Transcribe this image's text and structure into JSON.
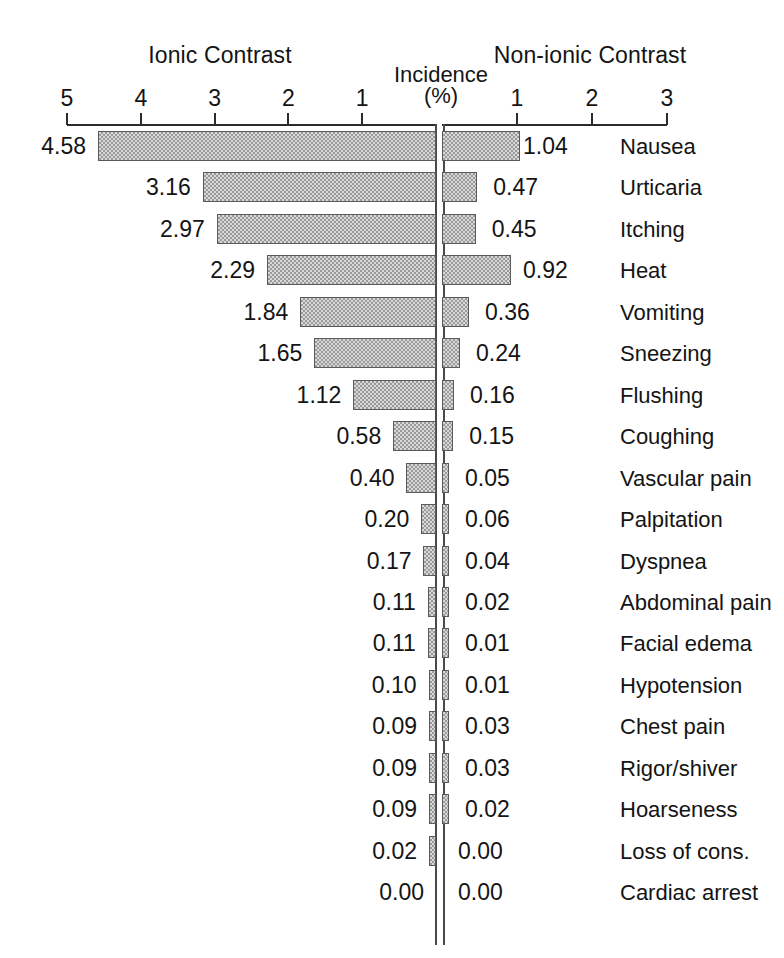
{
  "headings": {
    "left": "Ionic Contrast",
    "right": "Non-ionic Contrast",
    "axis_title_line1": "Incidence",
    "axis_title_line2": "(%)"
  },
  "chart_data": {
    "type": "bar",
    "title": "Incidence (%)",
    "orientation": "horizontal",
    "style": "diverging-bidirectional",
    "xlabel": "Incidence (%)",
    "ylabel": "",
    "grid": false,
    "legend_position": "top",
    "left_axis": {
      "name": "Ionic Contrast",
      "direction": "right-to-left",
      "ticks": [
        5,
        4,
        3,
        2,
        1
      ],
      "tick_labels": [
        "5",
        "4",
        "3",
        "2",
        "1"
      ],
      "xlim": [
        0,
        5
      ]
    },
    "right_axis": {
      "name": "Non-ionic Contrast",
      "direction": "left-to-right",
      "ticks": [
        1,
        2,
        3
      ],
      "tick_labels": [
        "1",
        "2",
        "3"
      ],
      "xlim": [
        0,
        3
      ]
    },
    "categories": [
      "Nausea",
      "Urticaria",
      "Itching",
      "Heat",
      "Vomiting",
      "Sneezing",
      "Flushing",
      "Coughing",
      "Vascular pain",
      "Palpitation",
      "Dyspnea",
      "Abdominal pain",
      "Facial edema",
      "Hypotension",
      "Chest pain",
      "Rigor/shiver",
      "Hoarseness",
      "Loss of cons.",
      "Cardiac arrest"
    ],
    "series": [
      {
        "name": "Ionic Contrast",
        "values": [
          4.58,
          3.16,
          2.97,
          2.29,
          1.84,
          1.65,
          1.12,
          0.58,
          0.4,
          0.2,
          0.17,
          0.11,
          0.11,
          0.1,
          0.09,
          0.09,
          0.09,
          0.02,
          0.0
        ],
        "labels": [
          "4.58",
          "3.16",
          "2.97",
          "2.29",
          "1.84",
          "1.65",
          "1.12",
          "0.58",
          "0.40",
          "0.20",
          "0.17",
          "0.11",
          "0.11",
          "0.10",
          "0.09",
          "0.09",
          "0.09",
          "0.02",
          "0.00"
        ]
      },
      {
        "name": "Non-ionic Contrast",
        "values": [
          1.04,
          0.47,
          0.45,
          0.92,
          0.36,
          0.24,
          0.16,
          0.15,
          0.05,
          0.06,
          0.04,
          0.02,
          0.01,
          0.01,
          0.03,
          0.03,
          0.02,
          0.0,
          0.0
        ],
        "labels": [
          "1.04",
          "0.47",
          "0.45",
          "0.92",
          "0.36",
          "0.24",
          "0.16",
          "0.15",
          "0.05",
          "0.06",
          "0.04",
          "0.02",
          "0.01",
          "0.01",
          "0.03",
          "0.03",
          "0.02",
          "0.00",
          "0.00"
        ]
      }
    ]
  },
  "colors": {
    "bar_fill": "#d8d8d8",
    "bar_hatch": "#9a9a9a",
    "bar_border": "#5a5a5a",
    "axis": "#2b2b2b",
    "text": "#141414",
    "background": "#ffffff"
  }
}
